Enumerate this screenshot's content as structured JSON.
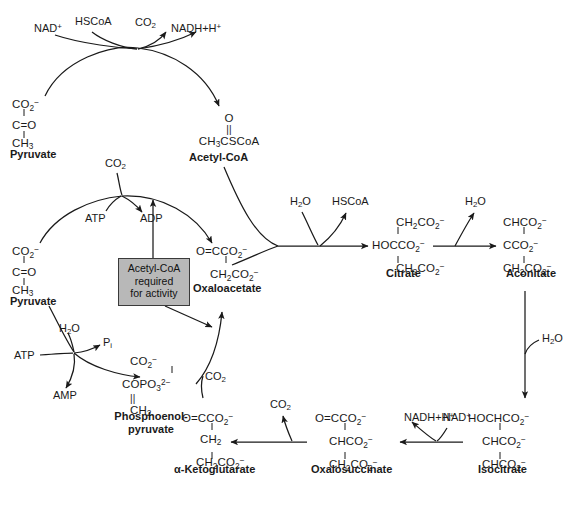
{
  "figure": {
    "background_color": "#ffffff",
    "ink_color": "#1a1a1a",
    "box_fill_color": "#b8b8b8",
    "box_border_color": "#3a3a3a"
  },
  "metabolites": {
    "pyruvate_top": {
      "name": "Pyruvate",
      "line1": "CO2-",
      "line2": "C=O",
      "line3": "CH3"
    },
    "acetyl_coa": {
      "name": "Acetyl-CoA",
      "line1": "O",
      "line2": "||",
      "line3": "CH3CSCoA"
    },
    "pyruvate_mid": {
      "name": "Pyruvate",
      "line1": "CO2-",
      "line2": "C=O",
      "line3": "CH3"
    },
    "oxaloacetate": {
      "name": "Oxaloacetate",
      "line1": "O=CCO2-",
      "line2": "CH2CO2-"
    },
    "citrate": {
      "name": "Citrate",
      "line1": "CH2CO2-",
      "line2": "HOCCO2-",
      "line3": "CH2CO2-"
    },
    "aconitate": {
      "name": "Aconitate",
      "line1": "CHCO2-",
      "line2": "CCO2-",
      "line3": "CH2CO2-"
    },
    "isocitrate": {
      "name": "Isocitrate",
      "line1": "HOCHCO2-",
      "line2": "CHCO2-",
      "line3": "CHCO2-"
    },
    "oxalosuccinate": {
      "name": "Oxalosuccinate",
      "line1": "O=CCO2-",
      "line2": "CHCO2-",
      "line3": "CH2CO2-"
    },
    "alpha_ketoglutarate": {
      "name": "α-Ketoglutarate",
      "line1": "O=CCO2-",
      "line2": "CH2",
      "line3": "CH2CO2-"
    },
    "phosphoenolpyruvate": {
      "name_line1": "Phosphoenol-",
      "name_line2": "pyruvate",
      "line1": "CO2-",
      "line2": "COPO3 2-",
      "line3": "||",
      "line4": "CH2"
    }
  },
  "cofactors": {
    "nad_plus_top": "NAD+",
    "hscoa_top": "HSCoA",
    "co2_top": "CO2",
    "nadh_h_top": "NADH+H+",
    "co2_pyruvate_carboxylase": "CO2",
    "atp_pyruvate_carboxylase": "ATP",
    "adp_pyruvate_carboxylase": "ADP",
    "h2o_citrate_synthase": "H2O",
    "hscoa_citrate_synthase": "HSCoA",
    "h2o_aconitase_1": "H2O",
    "h2o_aconitase_2": "H2O",
    "h2o_pepck": "H2O",
    "atp_pepck": "ATP",
    "amp_pepck": "AMP",
    "pi_pepck": "Pi",
    "co2_pep_carboxylase": "CO2",
    "co2_oxalosuccinate": "CO2",
    "nadh_h_isocitrate": "NADH+H+",
    "nad_plus_isocitrate": "NAD+"
  },
  "annotation_box": {
    "line1": "Acetyl-CoA",
    "line2": "required",
    "line3": "for activity"
  }
}
